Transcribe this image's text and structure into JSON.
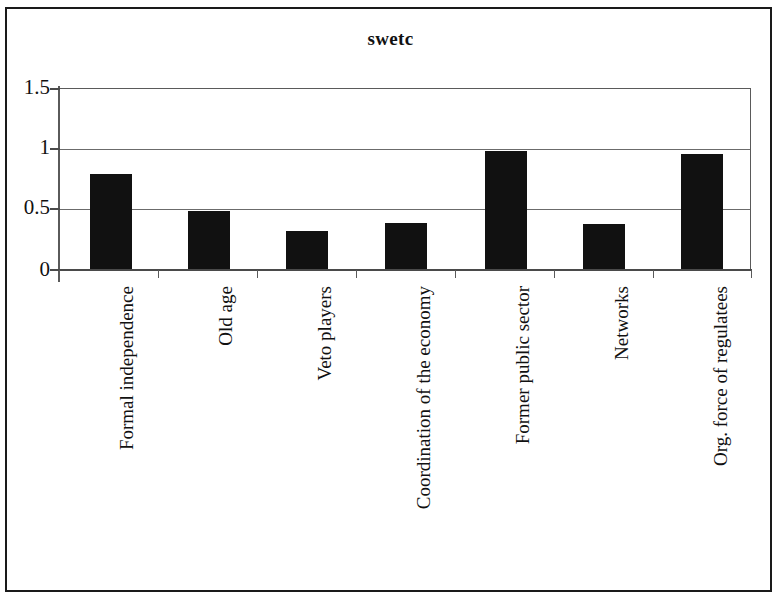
{
  "chart_data": {
    "type": "bar",
    "title": "swetc",
    "xlabel": "",
    "ylabel": "",
    "categories": [
      "Formal independence",
      "Old age",
      "Veto players",
      "Coordination of the economy",
      "Former public sector",
      "Networks",
      "Org. force of regulatees"
    ],
    "values": [
      0.79,
      0.49,
      0.32,
      0.39,
      0.98,
      0.38,
      0.96
    ],
    "ylim": [
      0,
      1.5
    ],
    "ytick_labels": [
      "0",
      "0.5",
      "1",
      "1.5"
    ],
    "ytick_values": [
      0,
      0.5,
      1,
      1.5
    ],
    "grid": true,
    "grid_axis": "y",
    "legend": false,
    "bar_color": "#111111",
    "axis_color": "#5a5a5a",
    "background_color": "#ffffff"
  },
  "figure": {
    "title": "swetc",
    "frame_visible": true
  }
}
